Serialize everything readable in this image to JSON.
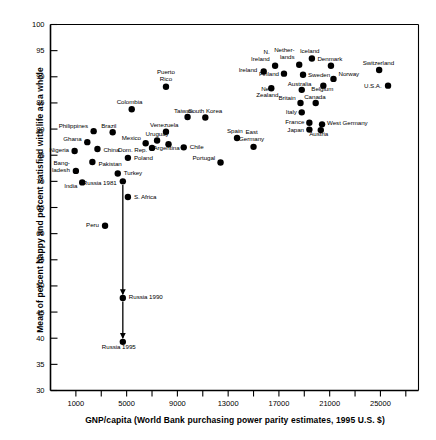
{
  "chart_data": {
    "type": "scatter",
    "title": "",
    "xlabel": "GNP/capita (World Bank purchasing power parity estimates, 1995 U.S. $)",
    "ylabel": "Mean of percent happy and percent satisfied with life as a whole",
    "xlim": [
      -1000,
      28000
    ],
    "ylim": [
      30,
      100
    ],
    "xticks": [
      1000,
      5000,
      9000,
      13000,
      17000,
      21000,
      25000
    ],
    "xtick_labels": [
      "1000",
      "5000",
      "9000",
      "13000",
      "17000",
      "21000",
      "25000"
    ],
    "yticks": [
      30,
      35,
      40,
      45,
      50,
      55,
      60,
      65,
      70,
      75,
      80,
      85,
      90,
      95,
      100
    ],
    "ytick_labels": [
      "30",
      "35",
      "40",
      "45",
      "50",
      "55",
      "60",
      "65",
      "70",
      "75",
      "80",
      "85",
      "90",
      "95",
      "100"
    ],
    "grid": false,
    "legend": "none",
    "points": [
      {
        "name": "Nigeria",
        "x": 900,
        "y": 75.8,
        "lx": -6,
        "ly": -1,
        "align": "r"
      },
      {
        "name": "Bang-\nladesh",
        "x": 1000,
        "y": 72.0,
        "lx": -6,
        "ly": -4,
        "align": "r"
      },
      {
        "name": "India",
        "x": 1500,
        "y": 69.8,
        "lx": -5,
        "ly": 4,
        "align": "r"
      },
      {
        "name": "Ghana",
        "x": 1900,
        "y": 77.5,
        "lx": -6,
        "ly": -3,
        "align": "r"
      },
      {
        "name": "Philippines",
        "x": 2400,
        "y": 79.6,
        "lx": -6,
        "ly": -5,
        "align": "r"
      },
      {
        "name": "Pakistan",
        "x": 2300,
        "y": 73.7,
        "lx": 6,
        "ly": 2,
        "align": "l"
      },
      {
        "name": "China",
        "x": 2700,
        "y": 76.2,
        "lx": 6,
        "ly": 2,
        "align": "l"
      },
      {
        "name": "Brazil",
        "x": 3900,
        "y": 79.4,
        "lx": -4,
        "ly": -6,
        "align": "c"
      },
      {
        "name": "Turkey",
        "x": 4300,
        "y": 71.5,
        "lx": 6,
        "ly": 0,
        "align": "l"
      },
      {
        "name": "Russia 1981",
        "x": 4700,
        "y": 70.0,
        "lx": -6,
        "ly": 2,
        "align": "r"
      },
      {
        "name": "Colombia",
        "x": 5400,
        "y": 83.8,
        "lx": -2,
        "ly": -7,
        "align": "c"
      },
      {
        "name": "Poland",
        "x": 5100,
        "y": 74.5,
        "lx": 6,
        "ly": 1,
        "align": "l"
      },
      {
        "name": "S. Africa",
        "x": 5100,
        "y": 67.0,
        "lx": 6,
        "ly": 0,
        "align": "l"
      },
      {
        "name": "Peru",
        "x": 3300,
        "y": 61.5,
        "lx": -6,
        "ly": 0,
        "align": "r"
      },
      {
        "name": "Russia 1990",
        "x": 4700,
        "y": 47.7,
        "lx": 6,
        "ly": 0,
        "align": "l"
      },
      {
        "name": "Russia 1995",
        "x": 4700,
        "y": 39.3,
        "lx": -4,
        "ly": 6,
        "align": "c"
      },
      {
        "name": "Mexico",
        "x": 6500,
        "y": 77.3,
        "lx": -5,
        "ly": -5,
        "align": "r"
      },
      {
        "name": "Dom. Rep.",
        "x": 7000,
        "y": 76.4,
        "lx": -5,
        "ly": 3,
        "align": "r"
      },
      {
        "name": "Uruguay",
        "x": 7400,
        "y": 77.8,
        "lx": 0,
        "ly": -6,
        "align": "c"
      },
      {
        "name": "Venezuela",
        "x": 8100,
        "y": 79.5,
        "lx": -2,
        "ly": -6,
        "align": "c"
      },
      {
        "name": "Argentina",
        "x": 8300,
        "y": 77.1,
        "lx": -2,
        "ly": 4,
        "align": "c"
      },
      {
        "name": "Chile",
        "x": 9500,
        "y": 76.5,
        "lx": 6,
        "ly": 0,
        "align": "l"
      },
      {
        "name": "Taiwan",
        "x": 9800,
        "y": 82.3,
        "lx": -4,
        "ly": -6,
        "align": "c"
      },
      {
        "name": "South Korea",
        "x": 11200,
        "y": 82.2,
        "lx": 0,
        "ly": -6,
        "align": "c"
      },
      {
        "name": "Puerto\nRico",
        "x": 8100,
        "y": 88.1,
        "lx": 0,
        "ly": -11,
        "align": "c"
      },
      {
        "name": "Portugal",
        "x": 12400,
        "y": 73.6,
        "lx": -5,
        "ly": -4,
        "align": "r"
      },
      {
        "name": "Spain",
        "x": 13700,
        "y": 78.3,
        "lx": -2,
        "ly": -6,
        "align": "c"
      },
      {
        "name": "East\nGermany",
        "x": 15000,
        "y": 76.6,
        "lx": -2,
        "ly": -11,
        "align": "c"
      },
      {
        "name": "Ireland",
        "x": 15800,
        "y": 91.0,
        "lx": -6,
        "ly": -1,
        "align": "r"
      },
      {
        "name": "N.\nIreland",
        "x": 16700,
        "y": 92.1,
        "lx": -5,
        "ly": -10,
        "align": "r"
      },
      {
        "name": "New\nZealand",
        "x": 16400,
        "y": 87.8,
        "lx": -4,
        "ly": 4,
        "align": "c"
      },
      {
        "name": "Finland",
        "x": 17400,
        "y": 90.6,
        "lx": -5,
        "ly": 1,
        "align": "r"
      },
      {
        "name": "Nether-\nlands",
        "x": 18600,
        "y": 92.3,
        "lx": -5,
        "ly": -11,
        "align": "r"
      },
      {
        "name": "Sweden",
        "x": 18900,
        "y": 90.4,
        "lx": 5,
        "ly": 1,
        "align": "l"
      },
      {
        "name": "Iceland",
        "x": 19600,
        "y": 93.5,
        "lx": -2,
        "ly": -7,
        "align": "c"
      },
      {
        "name": "Australia",
        "x": 18800,
        "y": 87.5,
        "lx": -2,
        "ly": -5,
        "align": "c"
      },
      {
        "name": "Britain",
        "x": 18700,
        "y": 85.0,
        "lx": -5,
        "ly": -4,
        "align": "r"
      },
      {
        "name": "Italy",
        "x": 18800,
        "y": 83.2,
        "lx": -5,
        "ly": 0,
        "align": "r"
      },
      {
        "name": "France",
        "x": 19400,
        "y": 81.2,
        "lx": -5,
        "ly": 0,
        "align": "r"
      },
      {
        "name": "Japan",
        "x": 19400,
        "y": 79.9,
        "lx": -5,
        "ly": 1,
        "align": "r"
      },
      {
        "name": "Denmark",
        "x": 21100,
        "y": 92.1,
        "lx": -1,
        "ly": -6,
        "align": "c"
      },
      {
        "name": "Norway",
        "x": 21300,
        "y": 89.6,
        "lx": 5,
        "ly": -4,
        "align": "l"
      },
      {
        "name": "Belgium",
        "x": 20500,
        "y": 88.3,
        "lx": -1,
        "ly": 4,
        "align": "c"
      },
      {
        "name": "Canada",
        "x": 19900,
        "y": 85.0,
        "lx": -1,
        "ly": -5,
        "align": "c"
      },
      {
        "name": "West Germany",
        "x": 20400,
        "y": 80.9,
        "lx": 5,
        "ly": -1,
        "align": "l"
      },
      {
        "name": "Austria",
        "x": 20300,
        "y": 79.8,
        "lx": -2,
        "ly": 4,
        "align": "c"
      },
      {
        "name": "Switzerland",
        "x": 24900,
        "y": 91.3,
        "lx": -1,
        "ly": -6,
        "align": "c"
      },
      {
        "name": "U.S.A.",
        "x": 25600,
        "y": 88.3,
        "lx": -6,
        "ly": 1,
        "align": "r"
      }
    ],
    "annotations": [
      {
        "type": "arrow-trajectory",
        "label": "Russia decline 1981-1995",
        "x": 4700,
        "segments": [
          {
            "from_y": 70.0,
            "to_y": 47.7
          },
          {
            "from_y": 47.7,
            "to_y": 39.3
          }
        ]
      }
    ]
  }
}
